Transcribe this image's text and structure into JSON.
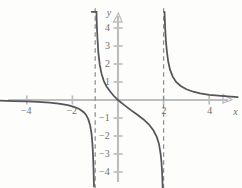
{
  "chart_data": {
    "type": "line",
    "title": "",
    "subtitle": "",
    "xlabel": "x",
    "ylabel": "y",
    "xlim": [
      -5.0,
      5.3
    ],
    "ylim": [
      -5.0,
      5.0
    ],
    "grid": false,
    "legend_position": "none",
    "xticks": [
      -4,
      -2,
      2,
      4
    ],
    "xtick_labels": [
      "−4",
      "−2",
      "2",
      "4"
    ],
    "yticks": [
      -4,
      -3,
      -2,
      -1,
      1,
      2,
      3,
      4
    ],
    "ytick_labels": [
      "−4",
      "−3",
      "−2",
      "−1",
      "1",
      "2",
      "3",
      "4"
    ],
    "annotations": [
      {
        "text": "y",
        "role": "y-axis-label",
        "x": -0.45,
        "y": 4.9
      },
      {
        "text": "x",
        "role": "x-axis-label",
        "x": 5.05,
        "y": -0.62
      }
    ],
    "asymptotes": {
      "vertical": [
        -1,
        2
      ],
      "vertical_labels": [
        "x = −1",
        "x = 2"
      ],
      "horizontal": [
        0
      ],
      "horizontal_labels": [
        "y = 0"
      ],
      "style": "dashed",
      "color": "#8d8d90"
    },
    "series": [
      {
        "name": "branch-left",
        "comment": "x < -1 branch: approaches y=0 from below at far left, falls to -infinity as x -> -1 from left",
        "x": [
          -5.2,
          -4.6,
          -4.0,
          -3.5,
          -3.0,
          -2.6,
          -2.2,
          -1.9,
          -1.7,
          -1.5,
          -1.4,
          -1.3,
          -1.22,
          -1.16,
          -1.12,
          -1.09,
          -1.07,
          -1.055
        ],
        "y": [
          -0.04,
          -0.06,
          -0.08,
          -0.11,
          -0.15,
          -0.2,
          -0.29,
          -0.4,
          -0.5,
          -0.68,
          -0.83,
          -1.08,
          -1.42,
          -1.88,
          -2.45,
          -3.2,
          -3.95,
          -4.8
        ]
      },
      {
        "name": "branch-middle",
        "comment": "-1 < x < 2 branch: +infinity near x=-1 from right, through origin (0,0), -infinity near x=2 from left",
        "x": [
          -0.945,
          -0.96,
          -0.975,
          -0.99,
          -1.01,
          -1.03,
          -1.06,
          -1.1,
          -1.15,
          -0.93,
          -0.9,
          -0.86,
          -0.8,
          -0.72,
          -0.62,
          -0.5,
          -0.36,
          -0.2,
          0.0,
          0.25,
          0.55,
          0.85,
          1.12,
          1.35,
          1.55,
          1.7,
          1.8,
          1.87,
          1.91,
          1.94,
          1.96
        ],
        "y": [
          4.9,
          4.9,
          4.9,
          4.9,
          4.9,
          4.9,
          4.9,
          4.9,
          4.9,
          4.2,
          3.4,
          2.6,
          1.95,
          1.45,
          1.05,
          0.75,
          0.5,
          0.25,
          0.0,
          -0.26,
          -0.55,
          -0.82,
          -1.08,
          -1.35,
          -1.68,
          -2.05,
          -2.45,
          -3.0,
          -3.5,
          -4.2,
          -4.9
        ]
      },
      {
        "name": "branch-right",
        "comment": "x > 2 branch: +infinity near x=2 from right, decays toward y=0 at far right",
        "x": [
          2.04,
          2.07,
          2.1,
          2.14,
          2.2,
          2.28,
          2.4,
          2.55,
          2.75,
          3.0,
          3.3,
          3.6,
          4.0,
          4.4,
          4.8,
          5.25
        ],
        "y": [
          4.9,
          3.95,
          3.3,
          2.75,
          2.15,
          1.7,
          1.3,
          1.0,
          0.78,
          0.6,
          0.46,
          0.37,
          0.29,
          0.24,
          0.2,
          0.16
        ]
      }
    ],
    "colors": {
      "curve": "#55555a",
      "axis": "#bdbdbf",
      "tick_label": "#6f6f71",
      "asymptote": "#8d8d90",
      "background": "#fdfdfc"
    }
  },
  "geometry": {
    "origin_px": {
      "x": 118,
      "y": 100
    },
    "unit_px": {
      "x": 22.8,
      "y": 18.0
    }
  }
}
